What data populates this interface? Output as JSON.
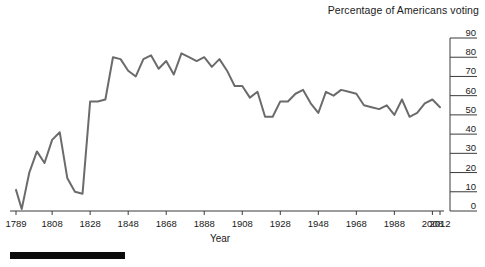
{
  "chart_data": {
    "type": "line",
    "title": "Percentage of Americans voting",
    "xlabel": "Year",
    "ylabel": "",
    "ylim": [
      0,
      90
    ],
    "xlim": [
      1789,
      2012
    ],
    "grid": false,
    "legend": "none",
    "line_color": "#6b6b6b",
    "axis_color": "#3a3a3a",
    "y_ticks": [
      90,
      80,
      70,
      60,
      50,
      40,
      30,
      20,
      10,
      0
    ],
    "y_tick_labels": [
      "90",
      "80",
      "70",
      "60",
      "50",
      "40",
      "30",
      "20",
      "10",
      "0"
    ],
    "x_ticks": [
      1789,
      1808,
      1828,
      1848,
      1868,
      1888,
      1908,
      1928,
      1948,
      1968,
      1988,
      2008,
      2012
    ],
    "x_tick_labels": [
      "1789",
      "1808",
      "1828",
      "1848",
      "1868",
      "1888",
      "1908",
      "1928",
      "1948",
      "1968",
      "1988",
      "2008",
      "2012"
    ],
    "x": [
      1789,
      1792,
      1796,
      1800,
      1804,
      1808,
      1812,
      1816,
      1820,
      1824,
      1828,
      1832,
      1836,
      1840,
      1844,
      1848,
      1852,
      1856,
      1860,
      1864,
      1868,
      1872,
      1876,
      1880,
      1884,
      1888,
      1892,
      1896,
      1900,
      1904,
      1908,
      1912,
      1916,
      1920,
      1924,
      1928,
      1932,
      1936,
      1940,
      1944,
      1948,
      1952,
      1956,
      1960,
      1964,
      1968,
      1972,
      1976,
      1980,
      1984,
      1988,
      1992,
      1996,
      2000,
      2004,
      2008,
      2012
    ],
    "values": [
      11,
      1,
      20,
      31,
      25,
      37,
      41,
      17,
      10,
      9,
      57,
      57,
      58,
      80,
      79,
      73,
      70,
      79,
      81,
      74,
      78,
      71,
      82,
      80,
      78,
      80,
      75,
      79,
      73,
      65,
      65,
      59,
      62,
      49,
      49,
      57,
      57,
      61,
      63,
      56,
      51,
      62,
      60,
      63,
      62,
      61,
      55,
      54,
      53,
      55,
      50,
      58,
      49,
      51,
      56,
      58,
      54
    ],
    "x_unit": "presidential election year",
    "y_unit": "percent"
  },
  "figure": {
    "footer_bar": "black-rule"
  }
}
